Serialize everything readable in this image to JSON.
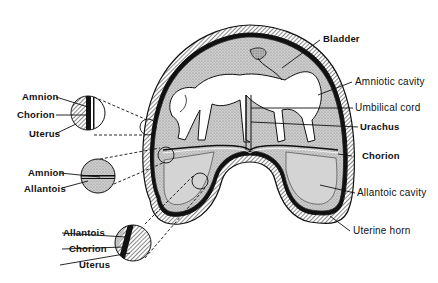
{
  "figure": {
    "type": "anatomical-diagram"
  },
  "labels": {
    "right": {
      "bladder": "Bladder",
      "amniotic_cavity": "Amniotic cavity",
      "umbilical_cord": "Umbilical cord",
      "urachus": "Urachus",
      "chorion": "Chorion",
      "allantoic_cavity": "Allantoic cavity",
      "uterine_horn": "Uterine horn"
    },
    "inset_top": {
      "amnion": "Amnion",
      "chorion": "Chorion",
      "uterus": "Uterus"
    },
    "inset_middle": {
      "amnion": "Amnion",
      "allantois": "Allantois"
    },
    "inset_bottom": {
      "allantois": "Allantois",
      "chorion": "Chorion",
      "uterus": "Uterus"
    }
  },
  "colors": {
    "ink": "#111111",
    "fluid_fill": "#c8c8c8",
    "background": "#ffffff"
  }
}
